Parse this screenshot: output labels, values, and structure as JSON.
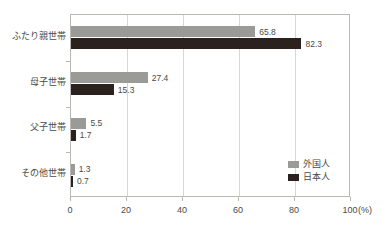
{
  "chart_data": {
    "type": "bar",
    "orientation": "horizontal",
    "title": "",
    "xlabel": "(%)",
    "ylabel": "",
    "xlim": [
      0,
      100
    ],
    "xticks": [
      "0",
      "20",
      "40",
      "60",
      "80",
      "100"
    ],
    "grid": "vertical",
    "legend_position": "bottom-right",
    "categories": [
      "ふたり親世帯",
      "母子世帯",
      "父子世帯",
      "その他世帯"
    ],
    "series": [
      {
        "name": "外国人",
        "color": "#9a9a96",
        "values": [
          65.8,
          27.4,
          5.5,
          1.3
        ],
        "labels": [
          "65.8",
          "27.4",
          "5.5",
          "1.3"
        ]
      },
      {
        "name": "日本人",
        "color": "#2b2220",
        "values": [
          82.3,
          15.3,
          1.7,
          0.7
        ],
        "labels": [
          "82.3",
          "15.3",
          "1.7",
          "0.7"
        ]
      }
    ]
  },
  "axis": {
    "unit_label": "(%)"
  },
  "colors": {
    "series_foreign": "#9a9a96",
    "series_japanese": "#2b2220",
    "frame": "#b9b9b4",
    "grid": "#d6d6d2",
    "text": "#4a4a46",
    "background": "#ffffff"
  }
}
